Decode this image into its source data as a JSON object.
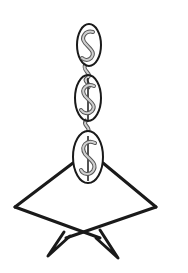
{
  "illustration": {
    "description": "Line drawing of a chain of three dollar-sign medallions hanging from above, attached to a kite/diamond-shaped body with two crossed legs below",
    "colors": {
      "background": "#ffffff",
      "outline": "#1a1a1a",
      "dollar_fill": "#bdbdbd",
      "dollar_stroke": "#555555"
    },
    "medallions": [
      {
        "symbol": "S",
        "cx": 89,
        "cy": 45,
        "rx": 12,
        "ry": 21
      },
      {
        "symbol": "$",
        "cx": 88,
        "cy": 98,
        "rx": 13,
        "ry": 23
      },
      {
        "symbol": "$",
        "cx": 88,
        "cy": 157,
        "rx": 15,
        "ry": 26
      }
    ],
    "body": {
      "shape": "diamond",
      "left_vertex": [
        15,
        207
      ],
      "right_vertex": [
        156,
        207
      ],
      "top_left_join": [
        73,
        163
      ],
      "top_right_join": [
        103,
        163
      ],
      "bottom_cross": [
        82,
        232
      ]
    },
    "legs": {
      "left_foot": [
        48,
        256
      ],
      "right_foot": [
        118,
        258
      ]
    }
  }
}
